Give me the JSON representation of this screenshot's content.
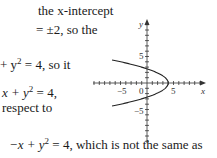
{
  "text": {
    "line1": "the x-intercept",
    "line2": "= ±2, so the",
    "line3_pre": "+ y",
    "line3_exp": "2",
    "line3_post": " = 4, so it",
    "line4_pre": "x + y",
    "line4_exp": "2",
    "line4_post": " = 4,",
    "line5": "respect to",
    "line6_pre": "−x + y",
    "line6_exp": "2",
    "line6_post": " = 4, which is not the same as"
  },
  "graph": {
    "equation": "x + y^2 = 4",
    "x_axis_label": "x",
    "y_axis_label": "y",
    "x_tick_labels": [
      "−5",
      "0",
      "5"
    ],
    "y_tick_labels": [
      "5",
      "−5"
    ],
    "vertex": [
      4,
      0
    ],
    "y_intercepts": [
      2,
      -2
    ],
    "x_range": [
      -10,
      11
    ],
    "y_range": [
      -11,
      12
    ]
  }
}
